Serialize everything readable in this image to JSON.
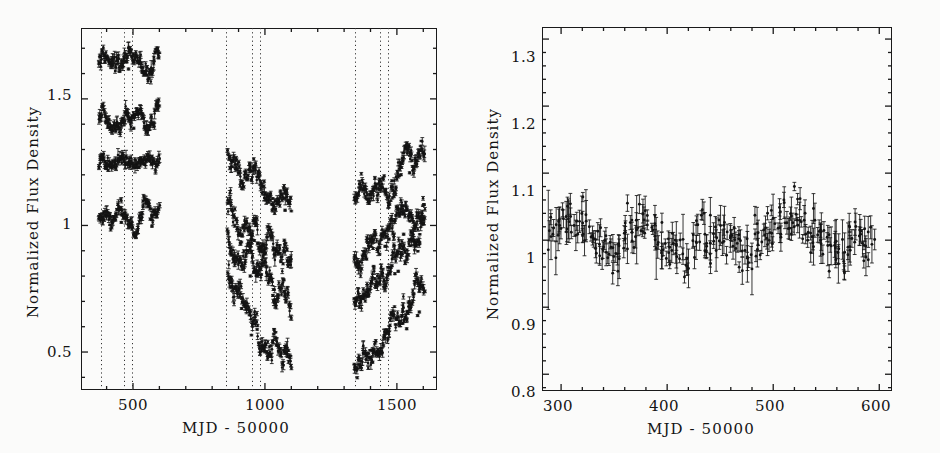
{
  "figure": {
    "width": 940,
    "height": 453,
    "background": "#fbfbfa",
    "ink": "#141414"
  },
  "chart_data": [
    {
      "id": "left-panel",
      "type": "scatter",
      "title": "",
      "xlabel": "MJD - 50000",
      "ylabel": "Normalized Flux Density",
      "xlim": [
        303,
        1652
      ],
      "ylim": [
        0.35,
        1.78
      ],
      "grid": false,
      "legend": false,
      "xticks": [
        500,
        1000,
        1500
      ],
      "xticklabels": [
        "500",
        "1000",
        "1500"
      ],
      "xminor_step": 100,
      "yticks": [
        0.5,
        1.0,
        1.5
      ],
      "yticklabels": [
        "0.5",
        "1",
        "1.5"
      ],
      "yminor_step": 0.1,
      "marker": "filled-circle-with-errorbar",
      "annotations": {
        "vertical_dotted_lines": [
          378,
          465,
          498,
          852,
          950,
          980,
          1340,
          1435,
          1468
        ]
      },
      "series": [
        {
          "name": "curve-A-top",
          "color": "#141414",
          "segments": [
            {
              "x_range": [
                370,
                600
              ],
              "y_range": [
                1.58,
                1.72
              ],
              "trend": "flat"
            },
            {
              "x_range": [
                858,
                1100
              ],
              "y_range": [
                1.07,
                1.27
              ],
              "trend": "decline"
            },
            {
              "x_range": [
                1338,
                1605
              ],
              "y_range": [
                1.1,
                1.3
              ],
              "trend": "rise"
            }
          ]
        },
        {
          "name": "curve-B",
          "color": "#141414",
          "segments": [
            {
              "x_range": [
                370,
                600
              ],
              "y_range": [
                1.35,
                1.47
              ],
              "trend": "flat"
            },
            {
              "x_range": [
                858,
                1100
              ],
              "y_range": [
                0.86,
                1.07
              ],
              "trend": "decline"
            },
            {
              "x_range": [
                1338,
                1605
              ],
              "y_range": [
                0.87,
                1.08
              ],
              "trend": "rise"
            }
          ]
        },
        {
          "name": "curve-C",
          "color": "#141414",
          "segments": [
            {
              "x_range": [
                370,
                600
              ],
              "y_range": [
                1.18,
                1.31
              ],
              "trend": "flat"
            },
            {
              "x_range": [
                858,
                1100
              ],
              "y_range": [
                0.7,
                0.97
              ],
              "trend": "decline"
            },
            {
              "x_range": [
                1338,
                1605
              ],
              "y_range": [
                0.73,
                0.97
              ],
              "trend": "rise"
            }
          ]
        },
        {
          "name": "curve-D-bottom",
          "color": "#141414",
          "segments": [
            {
              "x_range": [
                370,
                600
              ],
              "y_range": [
                0.96,
                1.1
              ],
              "trend": "flat"
            },
            {
              "x_range": [
                858,
                1100
              ],
              "y_range": [
                0.45,
                0.82
              ],
              "trend": "decline"
            },
            {
              "x_range": [
                1338,
                1605
              ],
              "y_range": [
                0.43,
                0.75
              ],
              "trend": "rise"
            }
          ]
        }
      ]
    },
    {
      "id": "right-panel",
      "type": "scatter",
      "title": "",
      "xlabel": "MJD - 50000",
      "ylabel": "Normalized Flux Density",
      "xlim": [
        282,
        612
      ],
      "ylim": [
        0.775,
        1.318
      ],
      "grid": false,
      "legend": false,
      "xticks": [
        300,
        400,
        500,
        600
      ],
      "xticklabels": [
        "300",
        "400",
        "500",
        "600"
      ],
      "xminor_step": 20,
      "yticks": [
        0.8,
        0.9,
        1.0,
        1.1,
        1.2,
        1.3
      ],
      "yticklabels": [
        "0.8",
        "0.9",
        "1",
        "1.1",
        "1.2",
        "1.3"
      ],
      "yminor_step": 0.02,
      "marker": "filled-circle-with-errorbar",
      "series": [
        {
          "name": "comparison-star-normalized-flux",
          "color": "#141414",
          "x_range": [
            288,
            594
          ],
          "y_mean": 1.0,
          "y_scatter": 0.025,
          "typical_errorbar": 0.018,
          "n_points": 300
        }
      ]
    }
  ]
}
